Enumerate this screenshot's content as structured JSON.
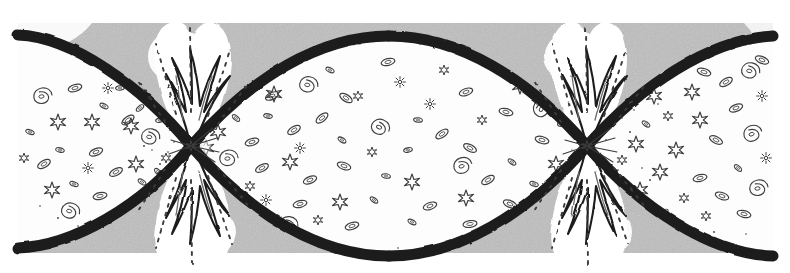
{
  "figure": {
    "title": "Oscillating (cyclic) universe diagram",
    "caption": "",
    "medium": "pen-and-ink line drawing with halftone stipple",
    "width": 790,
    "height": 273
  },
  "colors": {
    "page_background": "#ffffff",
    "panel_gray": "#b9b9b9",
    "panel_gray_dark": "#a9a9a9",
    "panel_gray_light": "#c9c9c9",
    "envelope_dark": "#1c1c1c",
    "interior_white": "#fdfdfd",
    "halo_white": "#ffffff",
    "ink_mid": "#555555",
    "ink_light": "#8c8c8c",
    "stipple": "#3a3a3a"
  },
  "panel": {
    "x": 18,
    "y": 23,
    "width": 755,
    "height": 230,
    "texture": "noise-speckle"
  },
  "envelope": {
    "stroke_color": "#1c1c1c",
    "stroke_width_max": 11,
    "stroke_width_min": 2,
    "description": "Two mirrored sinusoidal world-line boundaries that cross at the pinch points, enclosing lens-shaped universes."
  },
  "pinch_points": [
    {
      "id": "bang-left",
      "label": "singularity",
      "cx": 191,
      "cy": 146,
      "radius": 13
    },
    {
      "id": "crunch-right",
      "label": "singularity",
      "cx": 587,
      "cy": 146,
      "radius": 13
    }
  ],
  "lobes": [
    {
      "id": "lobe-left-partial",
      "label": "contracting epoch",
      "cx": 96,
      "cy": 146,
      "rx": 118,
      "ry": 108,
      "density": "medium"
    },
    {
      "id": "lobe-center",
      "label": "expansion epoch",
      "cx": 389,
      "cy": 146,
      "rx": 200,
      "ry": 110,
      "density": "high"
    },
    {
      "id": "lobe-right-partial",
      "label": "expansion epoch",
      "cx": 690,
      "cy": 146,
      "rx": 120,
      "ry": 108,
      "density": "medium"
    }
  ],
  "bursts": [
    {
      "id": "burst-left-top",
      "cx": 191,
      "cy": 146,
      "direction": "up",
      "spikes": 5,
      "reach": 126
    },
    {
      "id": "burst-left-bottom",
      "cx": 191,
      "cy": 146,
      "direction": "down",
      "spikes": 5,
      "reach": 122
    },
    {
      "id": "burst-right-top",
      "cx": 587,
      "cy": 146,
      "direction": "up",
      "spikes": 5,
      "reach": 126
    },
    {
      "id": "burst-right-bottom",
      "cx": 587,
      "cy": 146,
      "direction": "down",
      "spikes": 5,
      "reach": 122
    }
  ],
  "object_legend": [
    {
      "key": "spiral-galaxy",
      "label": "spiral galaxy",
      "glyph": "swirl"
    },
    {
      "key": "elliptical-galaxy",
      "label": "elliptical galaxy",
      "glyph": "oval"
    },
    {
      "key": "star-burst",
      "label": "star",
      "glyph": "six-point star"
    },
    {
      "key": "stipple-dot",
      "label": "distant matter",
      "glyph": "dot"
    }
  ],
  "chart_data": {
    "type": "line",
    "xlabel": "",
    "ylabel": "",
    "series": [
      {
        "name": "upper envelope",
        "description": "scale factor boundary, upper half"
      },
      {
        "name": "lower envelope",
        "description": "scale factor boundary, lower half, mirrored"
      }
    ],
    "zero_crossings": [
      191,
      587
    ],
    "maxima_x": [
      389
    ]
  }
}
